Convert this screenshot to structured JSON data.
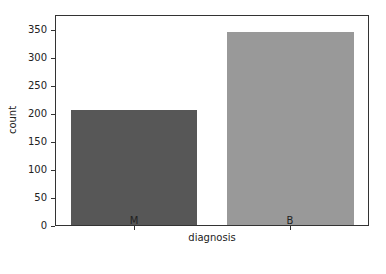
{
  "chart_data": {
    "type": "bar",
    "title": "",
    "xlabel": "diagnosis",
    "ylabel": "count",
    "categories": [
      "M",
      "B"
    ],
    "values": [
      212,
      357
    ],
    "colors": [
      "#575757",
      "#999999"
    ],
    "ylim": [
      0,
      375
    ],
    "yticks": [
      0,
      50,
      100,
      150,
      200,
      250,
      300,
      350
    ],
    "grid": false,
    "legend": null
  },
  "labels": {
    "xlabel": "diagnosis",
    "ylabel": "count",
    "xticks": [
      "M",
      "B"
    ],
    "yticks": [
      "0",
      "50",
      "100",
      "150",
      "200",
      "250",
      "300",
      "350"
    ]
  }
}
